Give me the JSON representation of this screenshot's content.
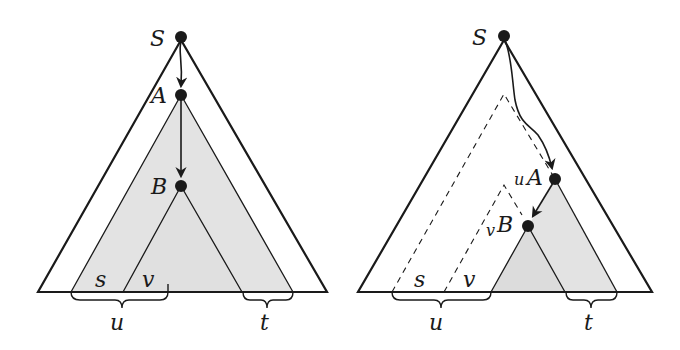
{
  "colors": {
    "stroke": "#1a1a1a",
    "shade": "#e3e3e3",
    "background": "#ffffff"
  },
  "left_diagram": {
    "nodes": [
      {
        "id": "S",
        "label": "S"
      },
      {
        "id": "A",
        "label": "A"
      },
      {
        "id": "B",
        "label": "B"
      }
    ],
    "leaf_labels": {
      "s": "s",
      "v": "v"
    },
    "braces": {
      "u": "u",
      "t": "t"
    }
  },
  "right_diagram": {
    "nodes": [
      {
        "id": "S",
        "label": "S"
      },
      {
        "id": "A",
        "label": "A",
        "prefix": "u"
      },
      {
        "id": "B",
        "label": "B",
        "prefix": "v"
      }
    ],
    "leaf_labels": {
      "s": "s",
      "v": "v"
    },
    "braces": {
      "u": "u",
      "t": "t"
    }
  }
}
